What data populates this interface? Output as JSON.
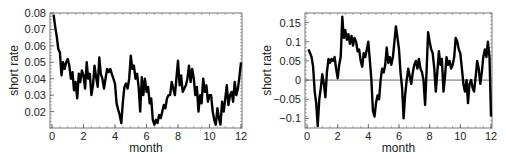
{
  "chart_data": [
    {
      "type": "line",
      "title": "",
      "xlabel": "month",
      "ylabel": "short rate",
      "xlim": [
        0,
        12
      ],
      "ylim": [
        0.01,
        0.08
      ],
      "xticks": [
        0,
        2,
        4,
        6,
        8,
        10,
        12
      ],
      "xtick_labels": [
        "0",
        "2",
        "4",
        "6",
        "8",
        "10",
        "12"
      ],
      "yticks": [
        0.02,
        0.03,
        0.04,
        0.05,
        0.06,
        0.07,
        0.08
      ],
      "ytick_labels": [
        "0.02",
        "0.03",
        "0.04",
        "0.05",
        "0.06",
        "0.07",
        "0.08"
      ],
      "grid": false,
      "zero_line": false,
      "series": [
        {
          "name": "short rate",
          "color": "#000000",
          "x": [
            0.1,
            0.2,
            0.3,
            0.4,
            0.5,
            0.6,
            0.7,
            0.8,
            0.9,
            1.0,
            1.1,
            1.2,
            1.3,
            1.4,
            1.5,
            1.6,
            1.7,
            1.8,
            1.9,
            2.0,
            2.1,
            2.2,
            2.3,
            2.4,
            2.5,
            2.6,
            2.7,
            2.8,
            2.9,
            3.0,
            3.1,
            3.2,
            3.3,
            3.4,
            3.5,
            3.6,
            3.7,
            3.8,
            3.9,
            4.0,
            4.1,
            4.2,
            4.3,
            4.4,
            4.5,
            4.6,
            4.7,
            4.8,
            4.9,
            5.0,
            5.1,
            5.2,
            5.3,
            5.4,
            5.5,
            5.6,
            5.7,
            5.8,
            5.9,
            6.0,
            6.1,
            6.2,
            6.3,
            6.4,
            6.5,
            6.6,
            6.7,
            6.8,
            6.9,
            7.0,
            7.1,
            7.2,
            7.3,
            7.4,
            7.5,
            7.6,
            7.7,
            7.8,
            7.9,
            8.0,
            8.1,
            8.2,
            8.3,
            8.4,
            8.5,
            8.6,
            8.7,
            8.8,
            8.9,
            9.0,
            9.1,
            9.2,
            9.3,
            9.4,
            9.5,
            9.6,
            9.7,
            9.8,
            9.9,
            10.0,
            10.1,
            10.2,
            10.3,
            10.4,
            10.5,
            10.6,
            10.7,
            10.8,
            10.9,
            11.0,
            11.1,
            11.2,
            11.3,
            11.4,
            11.5,
            11.6,
            11.7,
            11.8,
            11.9,
            12.0
          ],
          "values": [
            0.079,
            0.072,
            0.066,
            0.058,
            0.056,
            0.042,
            0.05,
            0.046,
            0.05,
            0.052,
            0.048,
            0.04,
            0.044,
            0.033,
            0.038,
            0.028,
            0.043,
            0.038,
            0.045,
            0.042,
            0.034,
            0.05,
            0.04,
            0.043,
            0.03,
            0.036,
            0.048,
            0.041,
            0.035,
            0.053,
            0.043,
            0.04,
            0.034,
            0.04,
            0.046,
            0.044,
            0.046,
            0.043,
            0.04,
            0.037,
            0.025,
            0.021,
            0.018,
            0.013,
            0.026,
            0.035,
            0.037,
            0.034,
            0.04,
            0.054,
            0.046,
            0.048,
            0.04,
            0.043,
            0.035,
            0.02,
            0.041,
            0.03,
            0.04,
            0.032,
            0.035,
            0.025,
            0.028,
            0.015,
            0.012,
            0.015,
            0.013,
            0.018,
            0.016,
            0.02,
            0.024,
            0.022,
            0.028,
            0.03,
            0.03,
            0.038,
            0.034,
            0.03,
            0.04,
            0.051,
            0.036,
            0.042,
            0.032,
            0.034,
            0.036,
            0.04,
            0.048,
            0.038,
            0.046,
            0.04,
            0.03,
            0.035,
            0.02,
            0.03,
            0.025,
            0.04,
            0.032,
            0.036,
            0.026,
            0.03,
            0.03,
            0.02,
            0.015,
            0.012,
            0.022,
            0.016,
            0.012,
            0.026,
            0.02,
            0.028,
            0.036,
            0.024,
            0.03,
            0.032,
            0.026,
            0.038,
            0.03,
            0.034,
            0.041,
            0.05,
            0.036,
            0.04,
            0.04,
            0.038,
            0.035,
            0.03,
            0.022,
            0.024,
            0.018,
            0.03,
            0.025,
            0.032
          ]
        }
      ]
    },
    {
      "type": "line",
      "title": "",
      "xlabel": "month",
      "ylabel": "short rate",
      "xlim": [
        0,
        12
      ],
      "ylim": [
        -0.125,
        0.175
      ],
      "xticks": [
        0,
        2,
        4,
        6,
        8,
        10,
        12
      ],
      "xtick_labels": [
        "0",
        "2",
        "4",
        "6",
        "8",
        "10",
        "12"
      ],
      "yticks": [
        -0.1,
        -0.05,
        0,
        0.05,
        0.1,
        0.15
      ],
      "ytick_labels": [
        "-0.1",
        "-0.05",
        "0",
        "0.05",
        "0.1",
        "0.15"
      ],
      "grid": false,
      "zero_line": true,
      "series": [
        {
          "name": "short rate",
          "color": "#000000",
          "x": [
            0.1,
            0.2,
            0.3,
            0.4,
            0.5,
            0.6,
            0.7,
            0.8,
            0.9,
            1.0,
            1.1,
            1.2,
            1.3,
            1.4,
            1.5,
            1.6,
            1.7,
            1.8,
            1.9,
            2.0,
            2.1,
            2.2,
            2.3,
            2.4,
            2.5,
            2.6,
            2.7,
            2.8,
            2.9,
            3.0,
            3.1,
            3.2,
            3.3,
            3.4,
            3.5,
            3.6,
            3.7,
            3.8,
            3.9,
            4.0,
            4.1,
            4.2,
            4.3,
            4.4,
            4.5,
            4.6,
            4.7,
            4.8,
            4.9,
            5.0,
            5.1,
            5.2,
            5.3,
            5.4,
            5.5,
            5.6,
            5.7,
            5.8,
            5.9,
            6.0,
            6.1,
            6.2,
            6.3,
            6.4,
            6.5,
            6.6,
            6.7,
            6.8,
            6.9,
            7.0,
            7.1,
            7.2,
            7.3,
            7.4,
            7.5,
            7.6,
            7.7,
            7.8,
            7.9,
            8.0,
            8.1,
            8.2,
            8.3,
            8.4,
            8.5,
            8.6,
            8.7,
            8.8,
            8.9,
            9.0,
            9.1,
            9.2,
            9.3,
            9.4,
            9.5,
            9.6,
            9.7,
            9.8,
            9.9,
            10.0,
            10.1,
            10.2,
            10.3,
            10.4,
            10.5,
            10.6,
            10.7,
            10.8,
            10.9,
            11.0,
            11.1,
            11.2,
            11.3,
            11.4,
            11.5,
            11.6,
            11.7,
            11.8,
            11.9,
            12.0
          ],
          "values": [
            0.08,
            0.07,
            0.06,
            0.035,
            -0.03,
            -0.06,
            -0.12,
            -0.05,
            -0.02,
            0.015,
            -0.01,
            -0.045,
            0.02,
            0.055,
            0.045,
            0.055,
            0.05,
            0.06,
            0.03,
            0.005,
            0.04,
            0.06,
            0.165,
            0.11,
            0.13,
            0.105,
            0.12,
            0.095,
            0.115,
            0.09,
            0.11,
            0.1,
            0.075,
            0.08,
            0.05,
            0.035,
            0.07,
            0.06,
            0.08,
            0.1,
            0.05,
            0.0,
            -0.08,
            -0.095,
            -0.06,
            -0.04,
            -0.05,
            0.0,
            0.03,
            0.02,
            0.04,
            0.085,
            0.045,
            0.06,
            0.04,
            0.06,
            0.1,
            0.14,
            0.11,
            0.08,
            0.02,
            -0.02,
            -0.1,
            -0.04,
            0.0,
            0.03,
            0.01,
            -0.01,
            0.02,
            0.04,
            0.05,
            0.03,
            0.055,
            0.03,
            0.02,
            0.0,
            -0.065,
            0.025,
            0.125,
            0.1,
            0.08,
            0.07,
            0.03,
            -0.03,
            0.02,
            0.075,
            0.04,
            0.055,
            -0.03,
            0.01,
            0.06,
            0.04,
            0.05,
            0.03,
            0.04,
            0.06,
            0.11,
            0.1,
            0.08,
            0.07,
            0.03,
            -0.01,
            -0.03,
            0.0,
            -0.06,
            -0.01,
            0.0,
            -0.02,
            -0.03,
            0.01,
            0.05,
            0.03,
            -0.01,
            0.02,
            0.06,
            0.08,
            0.06,
            0.1,
            0.06,
            -0.095
          ]
        }
      ]
    }
  ]
}
